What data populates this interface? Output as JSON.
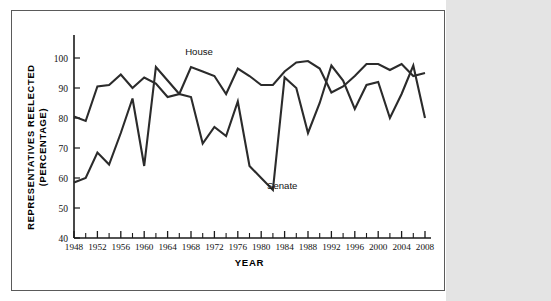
{
  "figure": {
    "frame_border_color": "#5a5a5a",
    "page_background": "#ffffff",
    "side_strip_color": "#e4e4e4"
  },
  "chart_data": {
    "type": "line",
    "title": "",
    "xlabel": "YEAR",
    "ylabel": "REPRESENTATIVES REELECTED (PERCENTAGE)",
    "ylabel_line1": "REPRESENTATIVES REELECTED",
    "ylabel_line2": "(PERCENTAGE)",
    "grid": false,
    "legend_position": "inline-annotations",
    "line_color": "#2b2b2b",
    "xlim": [
      1948,
      2008
    ],
    "ylim": [
      40,
      102
    ],
    "ytick_labels": [
      "40",
      "50",
      "60",
      "70",
      "80",
      "90",
      "100"
    ],
    "yticks": [
      40,
      50,
      60,
      70,
      80,
      90,
      100
    ],
    "xtick_labels": [
      "1948",
      "1952",
      "1956",
      "1960",
      "1964",
      "1968",
      "1972",
      "1976",
      "1980",
      "1984",
      "1988",
      "1992",
      "1996",
      "2000",
      "2004",
      "2008"
    ],
    "xticks_major": [
      1948,
      1952,
      1956,
      1960,
      1964,
      1968,
      1972,
      1976,
      1980,
      1984,
      1988,
      1992,
      1996,
      2000,
      2004,
      2008
    ],
    "xticks_minor": [
      1950,
      1954,
      1958,
      1962,
      1966,
      1970,
      1974,
      1978,
      1982,
      1986,
      1990,
      1994,
      1998,
      2002,
      2006
    ],
    "x": [
      1948,
      1950,
      1952,
      1954,
      1956,
      1958,
      1960,
      1962,
      1964,
      1966,
      1968,
      1970,
      1972,
      1974,
      1976,
      1978,
      1980,
      1982,
      1984,
      1986,
      1988,
      1990,
      1992,
      1994,
      1996,
      1998,
      2000,
      2002,
      2004,
      2006,
      2008
    ],
    "series": [
      {
        "name": "House",
        "label": "House",
        "label_x": 1967,
        "label_y": 101,
        "values": [
          80.5,
          79,
          90.5,
          91,
          94.5,
          90,
          93.5,
          91.5,
          87,
          88,
          97,
          95.5,
          94,
          88,
          96.5,
          94,
          91,
          91,
          95.5,
          98.5,
          99,
          96.5,
          88.5,
          90.5,
          94,
          98,
          98,
          96,
          98,
          94,
          95
        ]
      },
      {
        "name": "Senate",
        "label": "Senate",
        "label_x": 1981,
        "label_y": 56.5,
        "values": [
          58.5,
          60,
          68.5,
          64.5,
          75,
          86.5,
          64,
          97,
          92.5,
          88,
          87,
          71.5,
          77,
          74,
          85.5,
          64,
          60,
          56,
          93.5,
          90,
          75,
          85,
          97.5,
          92.5,
          83,
          91,
          92,
          80,
          88,
          97.5,
          80
        ]
      }
    ]
  }
}
